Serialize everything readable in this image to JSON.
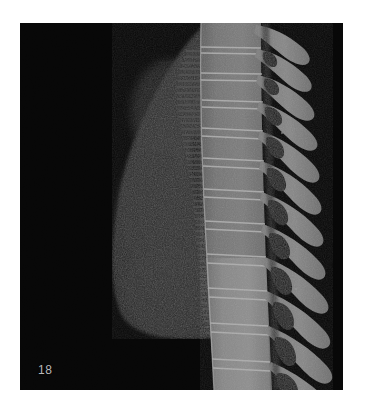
{
  "figure": {
    "domain": "medical-imaging",
    "modality": "CT",
    "view": "sagittal",
    "region": "thoracic spine and lung",
    "background_color": "#ffffff",
    "panel_background_color": "#030303",
    "panel": {
      "x": 20,
      "y": 23,
      "width": 323,
      "height": 367
    }
  },
  "overlay": {
    "slice_label": "18",
    "slice_label_color": "#b9b9b9"
  },
  "palette": {
    "air": "#030303",
    "lung_parenchyma_dark": "#161616",
    "lung_parenchyma_mid": "#242424",
    "lung_parenchyma_light": "#2e2e2e",
    "soft_tissue": "#3a3a3a",
    "airway_shadow": "#0d0d0d",
    "bone_mid": "#6d6d6d",
    "bone_bright": "#8e8e8e",
    "bone_edge": "#a6a6a6",
    "cortical_line": "#b4b4b4",
    "foramen_dark": "#141414"
  },
  "anatomy": {
    "lung": {
      "label": "lung field",
      "fill": "#212121",
      "outline_points": "185,0 168,16 150,40 132,70 116,104 104,140 96,176 92,210 92,246 96,280 106,300 126,308 152,312 176,314 196,313 210,308 214,296 214,0"
    },
    "airway_shadow": {
      "label": "central airway / vascular shadow",
      "fill": "#0b0b0b",
      "cx": 178,
      "cy": 160,
      "rx": 9,
      "ry": 52
    },
    "spine": {
      "label": "thoracic vertebral column",
      "column_fill": "#6d6d6d",
      "column_left_x": 178,
      "column_right_x": 246,
      "vertebra_count": 13,
      "vertebrae": [
        {
          "index": 1,
          "y": 2,
          "height": 22,
          "left": 182,
          "width": 60,
          "process_length": 48,
          "process_angle": 34,
          "process_y": 8,
          "foramen": null
        },
        {
          "index": 2,
          "y": 26,
          "height": 23,
          "left": 182,
          "width": 61,
          "process_length": 50,
          "process_angle": 33,
          "process_y": 32,
          "foramen": {
            "x": 232,
            "y": 32,
            "w": 13,
            "h": 11
          }
        },
        {
          "index": 3,
          "y": 51,
          "height": 24,
          "left": 182,
          "width": 62,
          "process_length": 52,
          "process_angle": 32,
          "process_y": 58,
          "foramen": {
            "x": 233,
            "y": 57,
            "w": 14,
            "h": 11
          }
        },
        {
          "index": 4,
          "y": 77,
          "height": 25,
          "left": 182,
          "width": 64,
          "process_length": 54,
          "process_angle": 31,
          "process_y": 85,
          "foramen": {
            "x": 234,
            "y": 83,
            "w": 14,
            "h": 12
          }
        },
        {
          "index": 5,
          "y": 104,
          "height": 26,
          "left": 182,
          "width": 65,
          "process_length": 56,
          "process_angle": 30,
          "process_y": 112,
          "foramen": {
            "x": 235,
            "y": 110,
            "w": 15,
            "h": 12
          }
        },
        {
          "index": 6,
          "y": 132,
          "height": 27,
          "left": 182,
          "width": 67,
          "process_length": 58,
          "process_angle": 29,
          "process_y": 141,
          "foramen": {
            "x": 236,
            "y": 138,
            "w": 15,
            "h": 13
          }
        },
        {
          "index": 7,
          "y": 161,
          "height": 28,
          "left": 183,
          "width": 69,
          "process_length": 59,
          "process_angle": 28,
          "process_y": 170,
          "foramen": {
            "x": 238,
            "y": 167,
            "w": 16,
            "h": 13
          }
        },
        {
          "index": 8,
          "y": 191,
          "height": 29,
          "left": 184,
          "width": 71,
          "process_length": 60,
          "process_angle": 26,
          "process_y": 200,
          "foramen": {
            "x": 240,
            "y": 197,
            "w": 16,
            "h": 14
          }
        },
        {
          "index": 9,
          "y": 222,
          "height": 30,
          "left": 185,
          "width": 73,
          "process_length": 61,
          "process_angle": 24,
          "process_y": 231,
          "foramen": {
            "x": 242,
            "y": 228,
            "w": 17,
            "h": 14
          }
        },
        {
          "index": 10,
          "y": 254,
          "height": 31,
          "left": 186,
          "width": 75,
          "process_length": 62,
          "process_angle": 21,
          "process_y": 263,
          "foramen": {
            "x": 244,
            "y": 260,
            "w": 17,
            "h": 15
          }
        },
        {
          "index": 11,
          "y": 287,
          "height": 32,
          "left": 187,
          "width": 77,
          "process_length": 62,
          "process_angle": 18,
          "process_y": 296,
          "foramen": {
            "x": 246,
            "y": 293,
            "w": 18,
            "h": 15
          }
        },
        {
          "index": 12,
          "y": 321,
          "height": 33,
          "left": 188,
          "width": 79,
          "process_length": 62,
          "process_angle": 14,
          "process_y": 330,
          "foramen": {
            "x": 248,
            "y": 327,
            "w": 18,
            "h": 16
          }
        },
        {
          "index": 13,
          "y": 356,
          "height": 34,
          "left": 189,
          "width": 81,
          "process_length": 60,
          "process_angle": 10,
          "process_y": 364,
          "foramen": {
            "x": 250,
            "y": 361,
            "w": 18,
            "h": 16
          }
        }
      ]
    },
    "costal_striations": {
      "label": "costovertebral rib stubs",
      "fill": "#4a4a4a",
      "x": 170,
      "y_start": 40,
      "y_end": 350,
      "count": 46,
      "length": 14
    }
  }
}
